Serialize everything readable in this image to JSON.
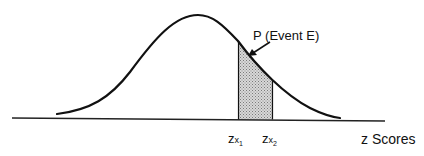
{
  "diagram": {
    "type": "normal-distribution",
    "event_label": "P (Event E)",
    "x_axis_label": "z Scores",
    "bounds": [
      {
        "base": "z",
        "sub": "x",
        "subsub": "1"
      },
      {
        "base": "z",
        "sub": "x",
        "subsub": "2"
      }
    ],
    "colors": {
      "line": "#111111",
      "shade": "#bdbdbd",
      "background": "#ffffff"
    }
  }
}
